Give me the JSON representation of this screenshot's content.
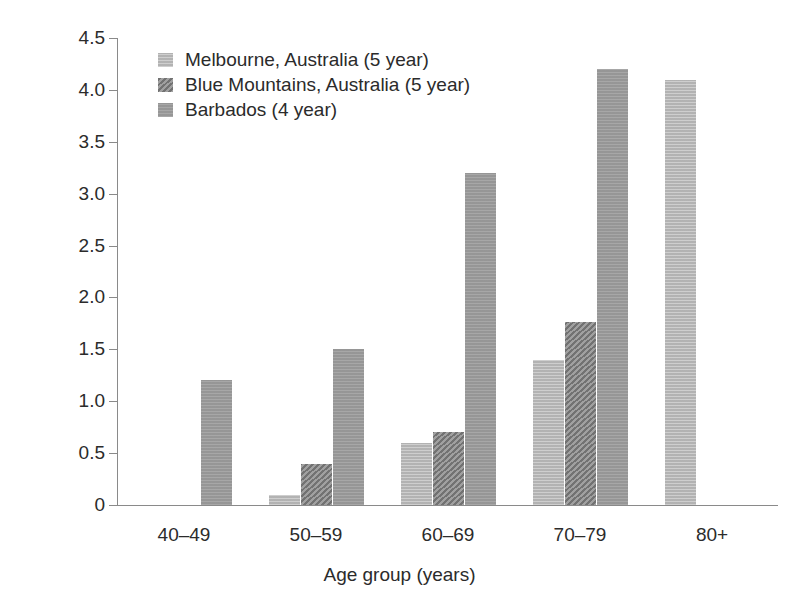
{
  "chart_data": {
    "type": "bar",
    "title": "",
    "subtitle": "",
    "xlabel": "Age group (years)",
    "ylabel": "Incidence (%)",
    "categories": [
      "40–49",
      "50–59",
      "60–69",
      "70–79",
      "80+"
    ],
    "series": [
      {
        "name": "Melbourne, Australia (5 year)",
        "color": "#b9b9b9",
        "pattern": "solid",
        "values": [
          null,
          0.1,
          0.6,
          1.4,
          4.1
        ]
      },
      {
        "name": "Blue Mountains, Australia (5 year)",
        "color": "#7f7f7f",
        "pattern": "diagonal-hatch",
        "values": [
          null,
          0.4,
          0.7,
          1.76,
          null
        ]
      },
      {
        "name": "Barbados (4 year)",
        "color": "#9b9b9b",
        "pattern": "solid",
        "values": [
          1.2,
          1.5,
          3.2,
          4.2,
          null
        ]
      }
    ],
    "ylim": [
      0,
      4.5
    ],
    "ytick_values": [
      0,
      0.5,
      1.0,
      1.5,
      2.0,
      2.5,
      3.0,
      3.5,
      4.0,
      4.5
    ],
    "ytick_labels": [
      "0",
      "0.5",
      "1.0",
      "1.5",
      "2.0",
      "2.5",
      "3.0",
      "3.5",
      "4.0",
      "4.5"
    ],
    "grid": false,
    "legend_position": "top-left",
    "background_color": "#ffffff",
    "axis_color": "#8a8a8a"
  },
  "axes": {
    "y_title": "Incidence (%)",
    "x_title": "Age group (years)"
  },
  "legend": {
    "items": [
      {
        "label": "Melbourne, Australia (5 year)"
      },
      {
        "label": "Blue Mountains, Australia (5 year)"
      },
      {
        "label": "Barbados (4 year)"
      }
    ]
  }
}
